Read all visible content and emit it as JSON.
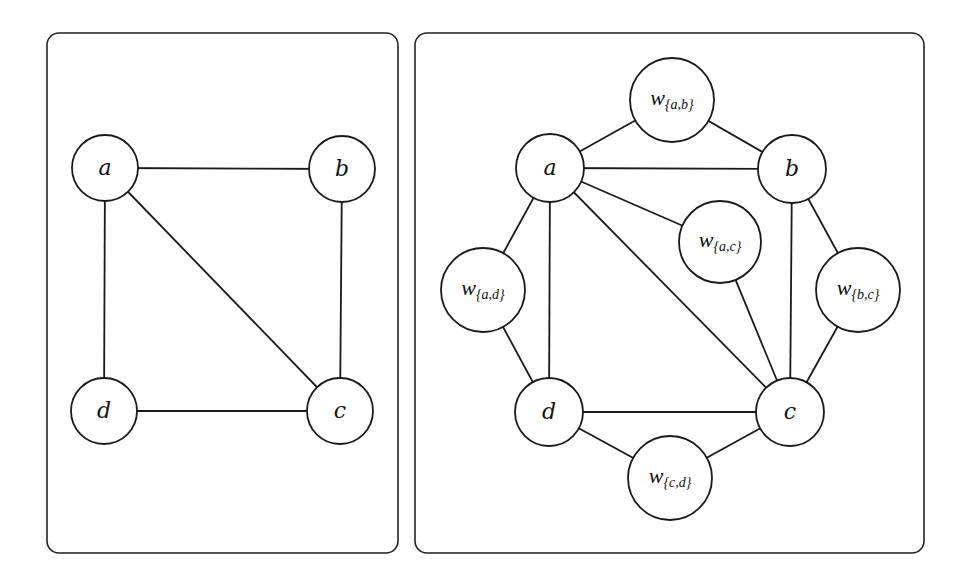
{
  "panels": [
    {
      "name": "original-graph",
      "nodes": [
        {
          "id": "a",
          "label": "a",
          "x": 105,
          "y": 168,
          "r": 33
        },
        {
          "id": "b",
          "label": "b",
          "x": 342,
          "y": 169,
          "r": 33
        },
        {
          "id": "c",
          "label": "c",
          "x": 340,
          "y": 411,
          "r": 33
        },
        {
          "id": "d",
          "label": "d",
          "x": 104,
          "y": 411,
          "r": 33
        }
      ],
      "edges": [
        [
          "a",
          "b"
        ],
        [
          "a",
          "c"
        ],
        [
          "a",
          "d"
        ],
        [
          "b",
          "c"
        ],
        [
          "c",
          "d"
        ]
      ]
    },
    {
      "name": "subdivided-graph",
      "nodes": [
        {
          "id": "a",
          "label": "a",
          "x": 550,
          "y": 168,
          "r": 34
        },
        {
          "id": "b",
          "label": "b",
          "x": 792,
          "y": 169,
          "r": 34
        },
        {
          "id": "c",
          "label": "c",
          "x": 790,
          "y": 412,
          "r": 34
        },
        {
          "id": "d",
          "label": "d",
          "x": 549,
          "y": 412,
          "r": 34
        },
        {
          "id": "wab",
          "label": "w",
          "sub": "{a,b}",
          "x": 672,
          "y": 100,
          "r": 42
        },
        {
          "id": "wac",
          "label": "w",
          "sub": "{a,c}",
          "x": 720,
          "y": 242,
          "r": 41
        },
        {
          "id": "wad",
          "label": "w",
          "sub": "{a,d}",
          "x": 483,
          "y": 290,
          "r": 42
        },
        {
          "id": "wbc",
          "label": "w",
          "sub": "{b,c}",
          "x": 858,
          "y": 290,
          "r": 42
        },
        {
          "id": "wcd",
          "label": "w",
          "sub": "{c,d}",
          "x": 670,
          "y": 478,
          "r": 42
        }
      ],
      "edges": [
        [
          "a",
          "b"
        ],
        [
          "a",
          "c"
        ],
        [
          "a",
          "d"
        ],
        [
          "b",
          "c"
        ],
        [
          "c",
          "d"
        ],
        [
          "a",
          "wab"
        ],
        [
          "wab",
          "b"
        ],
        [
          "a",
          "wac"
        ],
        [
          "wac",
          "c"
        ],
        [
          "a",
          "wad"
        ],
        [
          "wad",
          "d"
        ],
        [
          "b",
          "wbc"
        ],
        [
          "wbc",
          "c"
        ],
        [
          "d",
          "wcd"
        ],
        [
          "wcd",
          "c"
        ]
      ]
    }
  ]
}
